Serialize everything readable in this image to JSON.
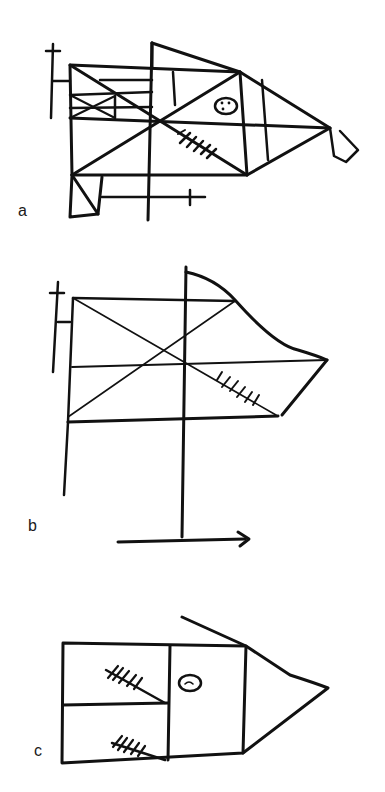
{
  "figure": {
    "panels": [
      {
        "id": "a",
        "label": "a"
      },
      {
        "id": "b",
        "label": "b"
      },
      {
        "id": "c",
        "label": "c"
      }
    ]
  },
  "colors": {
    "ink": "#111111",
    "background": "#ffffff"
  }
}
